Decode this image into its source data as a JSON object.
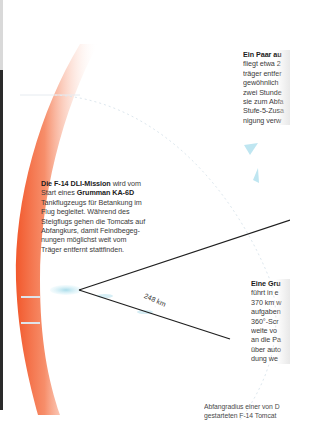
{
  "diagram": {
    "colors": {
      "outer_arc": "#f2582c",
      "carrier_marker": "#a9dcea",
      "lines": "#1f1f1f",
      "text": "#3a3a3a"
    },
    "radius_label": "248 km",
    "blocks": {
      "top": {
        "heading": "Ein Paar au",
        "lines": [
          "fliegt etwa 2",
          "träger entfer",
          "gewöhnlich",
          "zwei Stunde",
          "sie zum Abfa",
          "Stufe-5-Zusa",
          "nigung verw"
        ]
      },
      "mid": {
        "heading": "Die F-14 DLI-Mission",
        "heading_rest": " wird vom",
        "line2_pre": "Start eines ",
        "line2_bold": "Grumman KA-6D",
        "lines": [
          "Tankflugzeugs für Betankung im",
          "Flug begleitet. Während des",
          "Steigflugs gehen die Tomcats auf",
          "Abfangkurs, damit Feindbegeg-",
          "nungen möglichst weit vom",
          "Träger entfernt stattfinden."
        ]
      },
      "bottom": {
        "heading": "Eine Gru",
        "lines": [
          "führt in e",
          "370 km w",
          "aufgaben",
          "360°-Scr",
          "weite vo",
          "an die Pa",
          "über auto",
          "dung we"
        ]
      }
    },
    "caption": {
      "lines": [
        "Abfangradius einer von D",
        "gestarteten F-14 Tomcat"
      ]
    }
  }
}
